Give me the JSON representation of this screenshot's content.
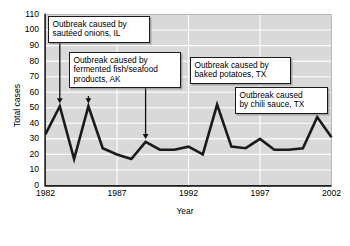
{
  "chart_data": {
    "type": "line",
    "title": "",
    "xlabel": "Year",
    "ylabel": "Total cases",
    "xlim": [
      1982,
      2002
    ],
    "ylim": [
      0,
      110
    ],
    "ytick_labels": [
      "110",
      "100",
      "90",
      "80",
      "70",
      "60",
      "50",
      "40",
      "30",
      "20",
      "10",
      "0"
    ],
    "ytick_values": [
      110,
      100,
      90,
      80,
      70,
      60,
      50,
      40,
      30,
      20,
      10,
      0
    ],
    "xtick_labels": [
      "1982",
      "1987",
      "1992",
      "1997",
      "2002"
    ],
    "xtick_values": [
      1982,
      1987,
      1992,
      1997,
      2002
    ],
    "grid": "horizontal-and-vertical-on-gray-panel",
    "legend_position": "none",
    "plot_bg_color": "#d9d9d9",
    "grid_color": "#ffffff",
    "line_color": "#1a1a1a",
    "x": [
      1982,
      1983,
      1984,
      1985,
      1986,
      1987,
      1988,
      1989,
      1990,
      1991,
      1992,
      1993,
      1994,
      1995,
      1996,
      1997,
      1998,
      1999,
      2000,
      2001,
      2002
    ],
    "values": [
      33,
      51,
      17,
      51,
      24,
      20,
      17,
      28,
      23,
      23,
      25,
      20,
      52,
      25,
      24,
      30,
      23,
      23,
      24,
      44,
      31
    ],
    "annotations": [
      {
        "id": "sauteed-onions",
        "lines": [
          "Outbreak caused by",
          "sautéed onions, IL"
        ],
        "points_to_x": 1983,
        "points_to_y": 51
      },
      {
        "id": "fermented-fish",
        "lines": [
          "Outbreak caused by",
          "fermented fish/seafood",
          "products, AK"
        ],
        "points_to_x": 1985,
        "points_to_y": 51
      },
      {
        "id": "baked-potatoes",
        "lines": [
          "Outbreak caused by",
          "baked potatoes, TX"
        ],
        "points_to_x": 1989,
        "points_to_y": 28
      },
      {
        "id": "chili-sauce",
        "lines": [
          "Outbreak caused",
          "by chili sauce, TX"
        ],
        "points_to_x": 2001,
        "points_to_y": 44
      }
    ]
  },
  "annotation_text": {
    "sauteed_onions_line1": "Outbreak caused by",
    "sauteed_onions_line2": "sautéed onions, IL",
    "fermented_fish_line1": "Outbreak caused by",
    "fermented_fish_line2": "fermented fish/seafood",
    "fermented_fish_line3": "products, AK",
    "baked_potatoes_line1": "Outbreak caused by",
    "baked_potatoes_line2": "baked potatoes, TX",
    "chili_sauce_line1": "Outbreak caused",
    "chili_sauce_line2": "by chili sauce, TX"
  },
  "axes": {
    "y_title": "Total cases",
    "x_title": "Year"
  }
}
